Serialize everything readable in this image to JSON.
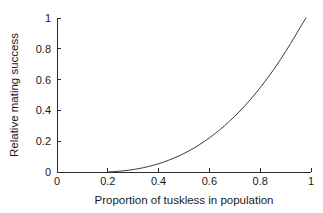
{
  "chart_data": {
    "type": "line",
    "title": "",
    "xlabel": "Proportion of tuskless in population",
    "ylabel": "Relative mating success",
    "xlim": [
      0,
      1
    ],
    "ylim": [
      0,
      1
    ],
    "xticks": [
      0,
      0.2,
      0.4,
      0.6,
      0.8,
      1
    ],
    "xticklabels": [
      "0",
      "0.2",
      "0.4",
      "0.6",
      "0.8",
      "1"
    ],
    "yticks": [
      0,
      0.2,
      0.4,
      0.6,
      0.8,
      1
    ],
    "yticklabels": [
      "0",
      "0.2",
      "0.4",
      "0.6",
      "0.8",
      "1"
    ],
    "grid": false,
    "legend": false,
    "legend_position": "none",
    "series": [
      {
        "name": "Relative mating success",
        "color": "#3a3a3a",
        "x": [
          0.2,
          0.24,
          0.28,
          0.32,
          0.36,
          0.4,
          0.44,
          0.48,
          0.52,
          0.56,
          0.6,
          0.64,
          0.68,
          0.72,
          0.76,
          0.8,
          0.84,
          0.88,
          0.92,
          0.96,
          0.98
        ],
        "y": [
          0.0,
          0.004,
          0.011,
          0.021,
          0.035,
          0.053,
          0.076,
          0.104,
          0.137,
          0.176,
          0.221,
          0.272,
          0.33,
          0.395,
          0.467,
          0.547,
          0.634,
          0.73,
          0.834,
          0.946,
          1.0
        ]
      }
    ]
  }
}
